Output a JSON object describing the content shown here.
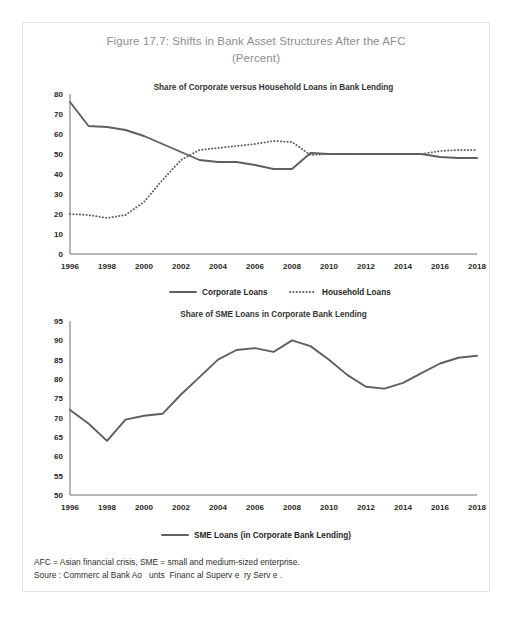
{
  "figure": {
    "title_line1": "Figure 17.7: Shifts in Bank Asset Structures After the AFC",
    "title_line2": "(Percent)",
    "title_color": "#8e8e8e",
    "line_color": "#5f5f5f"
  },
  "notes": {
    "line1": "AFC = Asian financial crisis, SME = small and medium-sized enterprise.",
    "line2": "Soure : Commerc al Bank Ao   unts  Financ al Superv e  ry Serv e ."
  },
  "chart_data": [
    {
      "type": "line",
      "title": "Share of Corporate versus Household Loans in Bank Lending",
      "xlabel": "",
      "ylabel": "",
      "ylim": [
        0,
        80
      ],
      "yticks": [
        0,
        10,
        20,
        30,
        40,
        50,
        60,
        70,
        80
      ],
      "xlim": [
        1996,
        2018
      ],
      "xticks": [
        1996,
        1998,
        2000,
        2002,
        2004,
        2006,
        2008,
        2010,
        2012,
        2014,
        2016,
        2018
      ],
      "grid": false,
      "legend_position": "bottom",
      "x": [
        1996,
        1997,
        1998,
        1999,
        2000,
        2001,
        2002,
        2003,
        2004,
        2005,
        2006,
        2007,
        2008,
        2009,
        2010,
        2011,
        2012,
        2013,
        2014,
        2015,
        2016,
        2017,
        2018
      ],
      "series": [
        {
          "name": "Corporate Loans",
          "style": "solid",
          "values": [
            76,
            64,
            63.5,
            62,
            59,
            55,
            51,
            47,
            46,
            46,
            44.5,
            42.5,
            42.5,
            50.5,
            50,
            50,
            50,
            50,
            50,
            50,
            48.5,
            48,
            48
          ]
        },
        {
          "name": "Household Loans",
          "style": "dotted",
          "values": [
            20,
            19.5,
            18,
            19.5,
            26,
            37,
            47,
            52,
            53,
            54,
            55,
            56.5,
            56,
            49.5,
            50,
            50,
            50,
            50,
            50,
            50,
            51.5,
            52,
            52
          ]
        }
      ]
    },
    {
      "type": "line",
      "title": "Share of SME Loans in Corporate Bank Lending",
      "xlabel": "",
      "ylabel": "",
      "ylim": [
        50,
        95
      ],
      "yticks": [
        50,
        55,
        60,
        65,
        70,
        75,
        80,
        85,
        90,
        95
      ],
      "xlim": [
        1996,
        2018
      ],
      "xticks": [
        1996,
        1998,
        2000,
        2002,
        2004,
        2006,
        2008,
        2010,
        2012,
        2014,
        2016,
        2018
      ],
      "grid": false,
      "legend_position": "bottom",
      "x": [
        1996,
        1997,
        1998,
        1999,
        2000,
        2001,
        2002,
        2003,
        2004,
        2005,
        2006,
        2007,
        2008,
        2009,
        2010,
        2011,
        2012,
        2013,
        2014,
        2015,
        2016,
        2017,
        2018
      ],
      "series": [
        {
          "name": "SME Loans (in Corporate Bank Lending)",
          "style": "solid",
          "values": [
            72,
            68.5,
            64,
            69.5,
            70.5,
            71,
            76,
            80.5,
            85,
            87.5,
            88,
            87,
            90,
            88.5,
            85,
            81,
            78,
            77.5,
            79,
            81.5,
            84,
            85.5,
            86
          ]
        }
      ]
    }
  ]
}
